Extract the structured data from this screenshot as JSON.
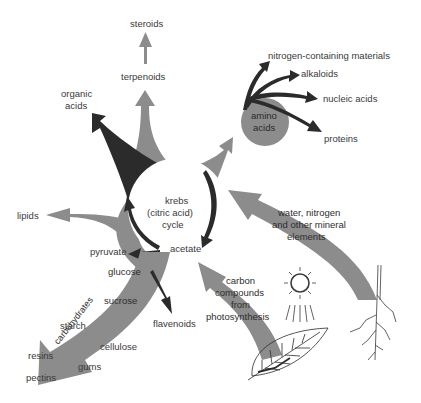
{
  "diagram": {
    "type": "metabolic pathway diagram",
    "colors": {
      "gray_arrow": "#8c8c8c",
      "dark_arrow": "#2b2b2b",
      "amino_circle": "#8c8c8c",
      "text": "#3a3a3a",
      "background": "#ffffff"
    },
    "center": {
      "label_line1": "krebs",
      "label_line2": "(citric acid)",
      "label_line3": "cycle",
      "acetate": "acetate",
      "pyruvate": "pyruvate"
    },
    "top": {
      "steroids": "steroids",
      "terpenoids": "terpenoids",
      "organic_acids_line1": "organic",
      "organic_acids_line2": "acids"
    },
    "amino": {
      "circle_line1": "amino",
      "circle_line2": "acids",
      "products": [
        "nitrogen-containing materials",
        "alkaloids",
        "nucleic acids",
        "proteins"
      ]
    },
    "left": {
      "lipids": "lipids"
    },
    "carbohydrates": {
      "band_label": "carbohydrates",
      "glucose": "glucose",
      "sucrose": "sucrose",
      "starch": "starch",
      "cellulose": "cellulose",
      "resins": "resins",
      "gums": "gums",
      "pectins": "pectins",
      "flavenoids": "flavenoids"
    },
    "inputs": {
      "water_line1": "water, nitrogen",
      "water_line2": "and other mineral",
      "water_line3": "elements",
      "carbon_line1": "carbon",
      "carbon_line2": "compounds",
      "carbon_line3": "from",
      "carbon_line4": "photosynthesis"
    },
    "illustrations": [
      "sun-icon",
      "leaf-icon",
      "root-icon"
    ]
  }
}
